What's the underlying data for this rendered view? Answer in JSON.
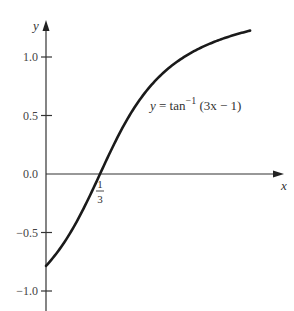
{
  "chart_data": {
    "type": "line",
    "title": "",
    "xlabel": "x",
    "ylabel": "y",
    "function": "y = tan^-1 (3x - 1)",
    "annotation": {
      "prefix": "y = tan",
      "superscript": "−1",
      "argument": "(3x − 1)"
    },
    "x_ticks": [
      {
        "value": 0.3333,
        "label_num": "1",
        "label_den": "3"
      }
    ],
    "y_ticks": [
      {
        "value": 1.0,
        "label": "1.0"
      },
      {
        "value": 0.5,
        "label": "0.5"
      },
      {
        "value": 0.0,
        "label": "0.0"
      },
      {
        "value": -0.5,
        "label": "−0.5"
      },
      {
        "value": -1.0,
        "label": "−1.0"
      }
    ],
    "xlim": [
      0,
      1.4
    ],
    "ylim": [
      -1.2,
      1.3
    ],
    "grid": false,
    "series": [
      {
        "name": "y = tan^-1 (3x - 1)",
        "x": [
          0,
          0.1,
          0.2,
          0.3333,
          0.5,
          0.6,
          0.8,
          1.0,
          1.26
        ],
        "values": [
          -0.785,
          -0.611,
          -0.381,
          0.0,
          0.464,
          0.675,
          0.961,
          1.107,
          1.226
        ]
      }
    ],
    "layout": {
      "origin_px": [
        46,
        174
      ],
      "x_px_per_unit": 162,
      "y_px_per_unit": 117,
      "curve_x_range": [
        0,
        1.26
      ],
      "y_axis_top_px": 20,
      "y_axis_bottom_px": 311,
      "x_axis_left_px": 46,
      "x_axis_right_px": 284
    }
  }
}
